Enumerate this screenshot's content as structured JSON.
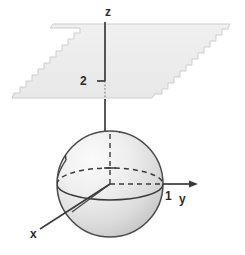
{
  "figure": {
    "background_color": "#ffffff",
    "stroke_color": "#3a3a3a",
    "plane_fill_color": "#ededed",
    "plane_stroke_color": "#cfcfcf",
    "sphere_fill_light": "#f2f2f2",
    "sphere_fill_dark": "#c9c9c9"
  },
  "axes": {
    "z": {
      "label": "z",
      "label_x": 105,
      "label_y": 16
    },
    "y": {
      "label": "y",
      "label_x": 179,
      "label_y": 203
    },
    "x": {
      "label": "x",
      "label_x": 30,
      "label_y": 238
    }
  },
  "ticks": [
    {
      "name": "z-tick-2",
      "label": "2",
      "axis": "z",
      "value": 2,
      "label_x": 80,
      "label_y": 85
    },
    {
      "name": "y-tick-1",
      "label": "1",
      "axis": "y",
      "value": 1,
      "label_x": 165,
      "label_y": 200
    }
  ],
  "objects": {
    "sphere": {
      "name": "unit-sphere",
      "center_x": 110,
      "center_y": 184,
      "radius": 53,
      "equator_ry": 16
    },
    "plane": {
      "name": "plane-z-equals-2",
      "description": "horizontal plane at z = 2 with torn jagged left and right edges",
      "z_value": 2
    }
  }
}
